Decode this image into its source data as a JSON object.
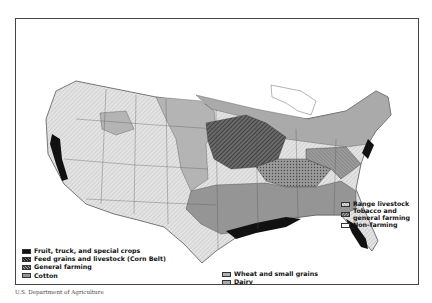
{
  "map": {
    "subject": "Major types of farming in the United States",
    "legend_left": [
      {
        "label": "Fruit, truck, and special crops",
        "pattern": "solid-black"
      },
      {
        "label": "Feed grains and livestock (Corn Belt)",
        "pattern": "diagonal-dark"
      },
      {
        "label": "General farming",
        "pattern": "crosshatch"
      },
      {
        "label": "Cotton",
        "pattern": "medium-gray"
      }
    ],
    "legend_center": [
      {
        "label": "Wheat and small grains",
        "pattern": "gray-dots"
      },
      {
        "label": "Dairy",
        "pattern": "light-gray"
      }
    ],
    "legend_right": [
      {
        "label": "Range livestock",
        "pattern": "light-diagonal"
      },
      {
        "label": "Tobacco and general farming",
        "line1": "Tobacco and",
        "line2": "general farming",
        "pattern": "gray-hatch"
      },
      {
        "label": "Non-farming",
        "pattern": "white"
      }
    ],
    "colors": {
      "fruit": "#111111",
      "corn_belt": "#4a4a4a",
      "general": "#8a8a8a",
      "cotton": "#9a9a9a",
      "wheat": "#b0b0b0",
      "dairy": "#aaaaaa",
      "range": "#dcdcdc",
      "tobacco": "#8c8c8c",
      "nonfarm": "#ffffff"
    }
  },
  "credit": "U.S. Department of Agriculture"
}
